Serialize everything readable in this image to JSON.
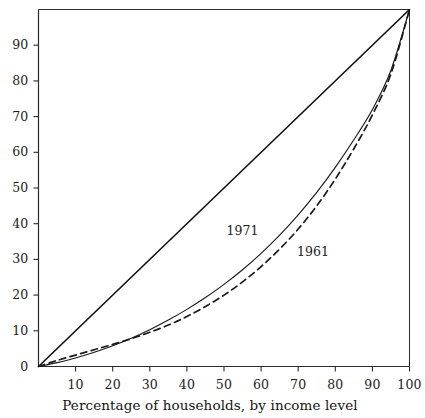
{
  "chart_data": {
    "type": "line",
    "title": "",
    "subtitle": "",
    "xlabel": "Percentage of households, by income level",
    "ylabel": "",
    "xlim": [
      0,
      100
    ],
    "ylim": [
      0,
      100
    ],
    "grid": false,
    "legend_position": "inline-annotation",
    "x_ticks": [
      10,
      20,
      30,
      40,
      50,
      60,
      70,
      80,
      90,
      100
    ],
    "x_tick_labels": [
      "10",
      "20",
      "30",
      "40",
      "50",
      "60",
      "70",
      "80",
      "90",
      "100"
    ],
    "y_ticks": [
      0,
      10,
      20,
      30,
      40,
      50,
      60,
      70,
      80,
      90
    ],
    "y_tick_labels": [
      "0",
      "10",
      "20",
      "30",
      "40",
      "50",
      "60",
      "70",
      "80",
      "90"
    ],
    "annotations": [
      {
        "text": "1971",
        "x": 55,
        "y": 38
      },
      {
        "text": "1961",
        "x": 74,
        "y": 32
      }
    ],
    "series": [
      {
        "name": "line-of-equality",
        "style": "solid",
        "label": "",
        "x": [
          0,
          100
        ],
        "values": [
          0,
          100
        ]
      },
      {
        "name": "1971",
        "style": "solid",
        "label": "1971",
        "x": [
          0,
          5,
          10,
          15,
          20,
          25,
          30,
          35,
          40,
          45,
          50,
          55,
          60,
          65,
          70,
          75,
          80,
          85,
          90,
          95,
          100
        ],
        "values": [
          0,
          1.1,
          2.4,
          4.0,
          5.8,
          7.9,
          10.3,
          13.0,
          16.0,
          19.3,
          23.0,
          27.1,
          31.7,
          36.8,
          42.5,
          48.8,
          55.8,
          63.5,
          72.0,
          83.0,
          100
        ]
      },
      {
        "name": "1961",
        "style": "dashed",
        "label": "1961",
        "x": [
          0,
          5,
          10,
          15,
          20,
          25,
          30,
          35,
          40,
          45,
          50,
          55,
          60,
          65,
          70,
          75,
          80,
          85,
          90,
          95,
          100
        ],
        "values": [
          0,
          1.7,
          3.2,
          4.7,
          6.2,
          7.8,
          9.6,
          11.6,
          14.0,
          16.8,
          20.0,
          23.7,
          28.0,
          32.9,
          38.5,
          45.0,
          52.5,
          61.0,
          70.5,
          82.0,
          100
        ]
      }
    ]
  },
  "colors": {
    "axis": "#2b2b2b",
    "series_1971": "#1a1a1a",
    "series_1961": "#1a1a1a",
    "equality": "#111111",
    "background": "#ffffff"
  },
  "axis_caption": {
    "text": "Percentage of households, by income level"
  }
}
